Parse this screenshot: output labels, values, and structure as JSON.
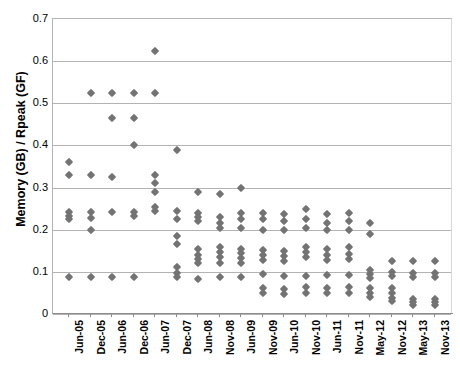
{
  "chart_data": {
    "type": "scatter",
    "title": "",
    "xlabel": "",
    "ylabel": "Memory (GB) / Rpeak (GF)",
    "ylim": [
      0,
      0.7
    ],
    "ytick_labels": [
      "0.7",
      "0.6",
      "0.5",
      "0.4",
      "0.3",
      "0.2",
      "0.1",
      "0"
    ],
    "ytick_values": [
      0.7,
      0.6,
      0.5,
      0.4,
      0.3,
      0.2,
      0.1,
      0
    ],
    "grid": true,
    "legend": "none",
    "marker": "diamond",
    "marker_color": "#737373",
    "categories": [
      "Jun-05",
      "Dec-05",
      "Jun-06",
      "Dec-06",
      "Jun-07",
      "Dec-07",
      "Jun-08",
      "Nov-08",
      "Jun-09",
      "Nov-09",
      "Jun-10",
      "Nov-10",
      "Jun-11",
      "Nov-11",
      "May-12",
      "Nov-12",
      "May-13",
      "Nov-13"
    ],
    "columns": [
      {
        "label": "Jun-05",
        "values": [
          0.36,
          0.33,
          0.243,
          0.232,
          0.225,
          0.088
        ]
      },
      {
        "label": "Dec-05",
        "values": [
          0.525,
          0.33,
          0.243,
          0.228,
          0.2,
          0.088
        ]
      },
      {
        "label": "Jun-06",
        "values": [
          0.525,
          0.465,
          0.325,
          0.243,
          0.088
        ]
      },
      {
        "label": "Dec-06",
        "values": [
          0.525,
          0.465,
          0.4,
          0.243,
          0.232,
          0.088
        ]
      },
      {
        "label": "Jun-07",
        "values": [
          0.623,
          0.525,
          0.33,
          0.31,
          0.29,
          0.255,
          0.245
        ]
      },
      {
        "label": "Dec-07",
        "values": [
          0.39,
          0.245,
          0.225,
          0.185,
          0.165,
          0.112,
          0.098,
          0.088
        ]
      },
      {
        "label": "Jun-08",
        "values": [
          0.29,
          0.24,
          0.23,
          0.22,
          0.155,
          0.14,
          0.13,
          0.12,
          0.083
        ]
      },
      {
        "label": "Nov-08",
        "values": [
          0.285,
          0.23,
          0.215,
          0.205,
          0.16,
          0.148,
          0.135,
          0.122,
          0.088
        ]
      },
      {
        "label": "Jun-09",
        "values": [
          0.3,
          0.24,
          0.225,
          0.205,
          0.155,
          0.145,
          0.133,
          0.12,
          0.088
        ]
      },
      {
        "label": "Nov-09",
        "values": [
          0.24,
          0.225,
          0.2,
          0.152,
          0.14,
          0.128,
          0.095,
          0.062,
          0.05
        ]
      },
      {
        "label": "Jun-10",
        "values": [
          0.238,
          0.22,
          0.2,
          0.15,
          0.138,
          0.125,
          0.09,
          0.06,
          0.048
        ]
      },
      {
        "label": "Nov-10",
        "values": [
          0.25,
          0.225,
          0.205,
          0.16,
          0.148,
          0.135,
          0.09,
          0.063,
          0.05
        ]
      },
      {
        "label": "Jun-11",
        "values": [
          0.238,
          0.215,
          0.2,
          0.155,
          0.14,
          0.128,
          0.092,
          0.062,
          0.05
        ]
      },
      {
        "label": "Nov-11",
        "values": [
          0.24,
          0.22,
          0.2,
          0.158,
          0.143,
          0.13,
          0.092,
          0.063,
          0.05
        ]
      },
      {
        "label": "May-12",
        "values": [
          0.215,
          0.19,
          0.105,
          0.095,
          0.085,
          0.062,
          0.05,
          0.04
        ]
      },
      {
        "label": "Nov-12",
        "values": [
          0.125,
          0.1,
          0.09,
          0.062,
          0.05,
          0.038,
          0.03
        ]
      },
      {
        "label": "May-13",
        "values": [
          0.125,
          0.098,
          0.088,
          0.035,
          0.028,
          0.022
        ]
      },
      {
        "label": "Nov-13",
        "values": [
          0.125,
          0.098,
          0.088,
          0.035,
          0.028,
          0.022
        ]
      }
    ]
  }
}
